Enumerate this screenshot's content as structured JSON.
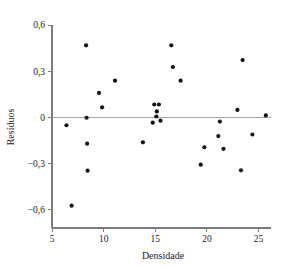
{
  "chart_data": {
    "type": "scatter",
    "title": "",
    "subtitle": "",
    "xlabel": "Densidade",
    "ylabel": "Resíduos",
    "xlim": [
      5,
      26.2
    ],
    "ylim": [
      -0.72,
      0.6
    ],
    "grid": false,
    "legend": null,
    "xticks": [
      5,
      10,
      15,
      20,
      25
    ],
    "xtick_labels": [
      "5",
      "10",
      "15",
      "20",
      "25"
    ],
    "yticks": [
      0.6,
      0.3,
      0,
      -0.3,
      -0.6
    ],
    "ytick_labels": [
      "0,6",
      "0,3",
      "0",
      "−0,3",
      "−0,6"
    ],
    "reference_line_y": 0,
    "marker": {
      "shape": "circle",
      "color": "#141414",
      "size_px": 3.0
    },
    "points": [
      {
        "x": 6.4,
        "y": -0.052
      },
      {
        "x": 6.9,
        "y": -0.575
      },
      {
        "x": 8.3,
        "y": 0.468
      },
      {
        "x": 8.35,
        "y": -0.003
      },
      {
        "x": 8.4,
        "y": -0.172
      },
      {
        "x": 8.45,
        "y": -0.347
      },
      {
        "x": 9.55,
        "y": 0.158
      },
      {
        "x": 9.85,
        "y": 0.065
      },
      {
        "x": 11.1,
        "y": 0.238
      },
      {
        "x": 13.8,
        "y": -0.163
      },
      {
        "x": 14.75,
        "y": -0.035
      },
      {
        "x": 14.9,
        "y": 0.083
      },
      {
        "x": 15.1,
        "y": 0.005
      },
      {
        "x": 15.15,
        "y": 0.038
      },
      {
        "x": 15.35,
        "y": 0.083
      },
      {
        "x": 15.5,
        "y": -0.022
      },
      {
        "x": 16.55,
        "y": 0.468
      },
      {
        "x": 16.7,
        "y": 0.327
      },
      {
        "x": 17.45,
        "y": 0.238
      },
      {
        "x": 19.4,
        "y": -0.308
      },
      {
        "x": 19.75,
        "y": -0.195
      },
      {
        "x": 21.1,
        "y": -0.122
      },
      {
        "x": 21.25,
        "y": -0.028
      },
      {
        "x": 21.6,
        "y": -0.205
      },
      {
        "x": 22.95,
        "y": 0.048
      },
      {
        "x": 23.3,
        "y": -0.345
      },
      {
        "x": 23.45,
        "y": 0.372
      },
      {
        "x": 24.4,
        "y": -0.112
      },
      {
        "x": 25.7,
        "y": 0.012
      }
    ]
  },
  "axes_geometry": {
    "left_px": 52,
    "right_px": 271,
    "top_px": 25,
    "bottom_px": 228
  }
}
